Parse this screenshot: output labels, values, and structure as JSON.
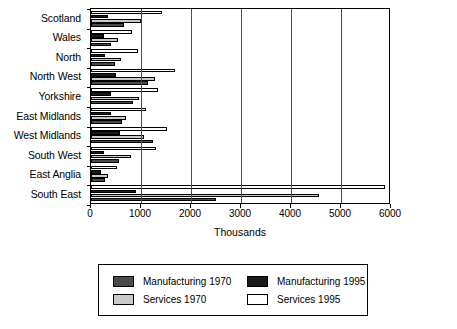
{
  "chart_data": {
    "type": "bar",
    "orientation": "horizontal",
    "title": "",
    "xlabel": "Thousands",
    "ylabel": "",
    "xlim": [
      0,
      6000
    ],
    "xticks": [
      0,
      1000,
      2000,
      3000,
      4000,
      5000,
      6000
    ],
    "xticklabels": [
      "0",
      "1000",
      "2000",
      "3000",
      "4000",
      "5000",
      "6000"
    ],
    "grid": true,
    "legend_position": "below-chart",
    "categories": [
      "Scotland",
      "Wales",
      "North",
      "North West",
      "Yorkshire",
      "East Midlands",
      "West Midlands",
      "South West",
      "East Anglia",
      "South East"
    ],
    "series": [
      {
        "name": "Services 1995",
        "color": "#ffffff",
        "values": [
          1420,
          820,
          930,
          1670,
          1330,
          1090,
          1520,
          1300,
          520,
          5880
        ]
      },
      {
        "name": "Manufacturing 1995",
        "color": "#1a1a1a",
        "values": [
          330,
          250,
          270,
          490,
          390,
          390,
          570,
          260,
          190,
          900
        ]
      },
      {
        "name": "Services 1970",
        "color": "#c9c9c9",
        "values": [
          1000,
          530,
          590,
          1270,
          960,
          700,
          1060,
          800,
          330,
          4550
        ]
      },
      {
        "name": "Manufacturing 1970",
        "color": "#4a4a4a",
        "values": [
          660,
          390,
          470,
          1130,
          840,
          620,
          1240,
          560,
          270,
          2500
        ]
      }
    ]
  },
  "legend": {
    "items": [
      {
        "label": "Manufacturing 1970",
        "color": "#4a4a4a"
      },
      {
        "label": "Manufacturing 1995",
        "color": "#1a1a1a"
      },
      {
        "label": "Services 1970",
        "color": "#c9c9c9"
      },
      {
        "label": "Services 1995",
        "color": "#ffffff"
      }
    ]
  }
}
